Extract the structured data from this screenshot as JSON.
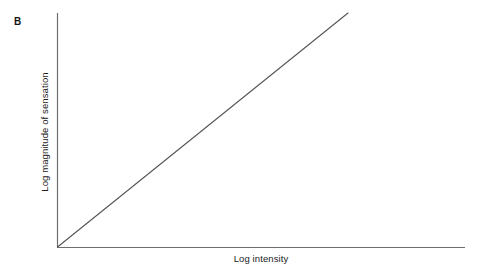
{
  "figure": {
    "panel_label": "B",
    "background_color": "#ffffff",
    "axis_color": "#6e6e6e",
    "data_line_color": "#555555",
    "text_color": "#1a1a1a"
  },
  "chart_data": {
    "type": "line",
    "title": "",
    "subtitle": "",
    "panel": "B",
    "xlabel": "Log intensity",
    "ylabel": "Log magnitude of sensation",
    "xlim": [
      0,
      1
    ],
    "ylim": [
      0,
      1
    ],
    "grid": false,
    "legend": null,
    "xticks": [],
    "yticks": [],
    "xticklabels": [],
    "yticklabels": [],
    "annotations": [],
    "series": [
      {
        "name": "power-law in log-log coordinates",
        "x": [
          0,
          1
        ],
        "y": [
          0,
          1
        ],
        "slope": 1,
        "intercept": 0,
        "style": "solid",
        "color": "#555555"
      }
    ],
    "axes_geometry": {
      "origin_px": [
        57,
        247
      ],
      "y_axis_top_px": [
        57,
        13
      ],
      "x_axis_right_px": [
        465,
        247
      ],
      "line_end_px": [
        348,
        13
      ]
    }
  }
}
